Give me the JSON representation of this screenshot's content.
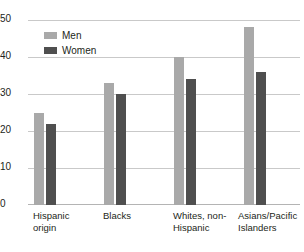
{
  "chart_data": {
    "type": "bar",
    "title": "",
    "subtitle": "",
    "xlabel": "",
    "ylabel": "",
    "ylim": [
      0,
      50
    ],
    "yticks": [
      0,
      10,
      20,
      30,
      40,
      50
    ],
    "ytick_labels": [
      "0",
      "10",
      "20",
      "30",
      "40",
      "50"
    ],
    "grid": true,
    "legend_position": "top-left-inside",
    "categories": [
      "Hispanic origin",
      "Blacks",
      "Whites, non-Hispanic",
      "Asians/Pacific Islanders"
    ],
    "category_lines": [
      [
        "Hispanic",
        "origin"
      ],
      [
        "Blacks",
        ""
      ],
      [
        "Whites, non-",
        "Hispanic"
      ],
      [
        "Asians/Pacific",
        "Islanders"
      ]
    ],
    "series": [
      {
        "name": "Men",
        "color": "#a9a9a9",
        "values": [
          25,
          33,
          40,
          48
        ]
      },
      {
        "name": "Women",
        "color": "#4f4f4f",
        "values": [
          22,
          30,
          34,
          36
        ]
      }
    ]
  },
  "legend": {
    "items": [
      {
        "label": "Men",
        "color": "#a9a9a9"
      },
      {
        "label": "Women",
        "color": "#4f4f4f"
      }
    ]
  },
  "axis": {
    "y_tick_labels": [
      "50",
      "40",
      "30",
      "20",
      "10",
      "0"
    ]
  },
  "colors": {
    "men": "#a9a9a9",
    "women": "#4f4f4f",
    "gridline": "#c9c9c9",
    "baseline": "#b4b4b4",
    "text": "#231f20",
    "background": "#ffffff"
  }
}
